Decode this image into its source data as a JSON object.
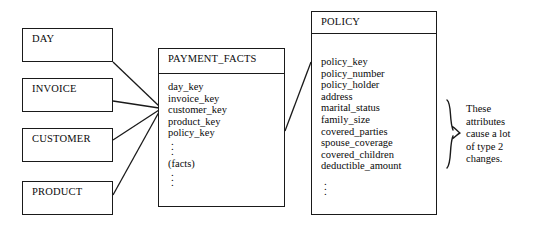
{
  "diagram": {
    "dimension_tables": [
      {
        "name": "DAY"
      },
      {
        "name": "INVOICE"
      },
      {
        "name": "CUSTOMER"
      },
      {
        "name": "PRODUCT"
      }
    ],
    "fact_table": {
      "name": "PAYMENT_FACTS",
      "keys": [
        "day_key",
        "invoice_key",
        "customer_key",
        "product_key",
        "policy_key"
      ],
      "measures_label": "(facts)",
      "ellipsis": "."
    },
    "policy_table": {
      "name": "POLICY",
      "attributes": [
        "policy_key",
        "policy_number",
        "policy_holder",
        "address",
        "marital_status",
        "family_size",
        "covered_parties",
        "spouse_coverage",
        "covered_children",
        "deductible_amount"
      ],
      "ellipsis": "."
    },
    "annotation": {
      "lines": [
        "These",
        "attributes",
        "cause a lot",
        "of type 2",
        "changes."
      ]
    },
    "colors": {
      "stroke": "#1a1a1a",
      "text": "#0a0a0a",
      "background": "#ffffff"
    }
  }
}
